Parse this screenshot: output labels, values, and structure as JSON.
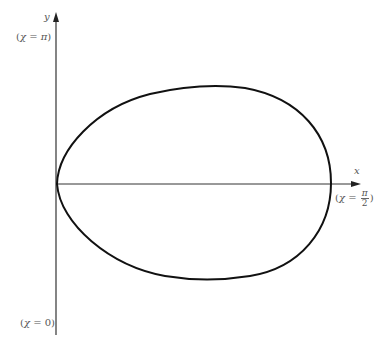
{
  "diagram": {
    "type": "polar-curve-plot",
    "axes": {
      "y_label": "y",
      "x_label": "x"
    },
    "annotations": {
      "top": {
        "open": "(",
        "var": "χ",
        "eq": " = ",
        "val": "π",
        "close": ")"
      },
      "bottom": {
        "open": "(",
        "var": "χ",
        "eq": " = ",
        "val": "0",
        "close": ")"
      },
      "right": {
        "open": "(",
        "var": "χ",
        "eq": " = ",
        "num": "π",
        "den": "2",
        "close": ")"
      }
    },
    "curve": {
      "shape": "egg-shaped closed loop",
      "stroke_color": "#111111",
      "left_point": [
        57,
        184
      ],
      "right_point": [
        331,
        183
      ],
      "top_point": [
        215,
        85
      ],
      "bottom_point": [
        210,
        279
      ]
    },
    "colors": {
      "axis": "#333333",
      "curve": "#111111",
      "label": "#555555",
      "background": "#ffffff"
    }
  }
}
